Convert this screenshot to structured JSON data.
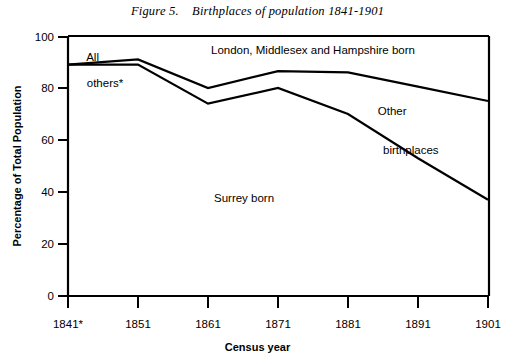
{
  "figure": {
    "title": "Figure 5.    Birthplaces of population 1841-1901"
  },
  "chart_data": {
    "type": "line",
    "title": "Figure 5.    Birthplaces of population 1841-1901",
    "xlabel": "Census year",
    "ylabel": "Percentage of Total Population",
    "xlim": [
      1841,
      1901
    ],
    "ylim": [
      0,
      100
    ],
    "grid": false,
    "legend_position": "inline-annotations",
    "x": [
      1841,
      1851,
      1861,
      1871,
      1881,
      1891,
      1901
    ],
    "xtick_labels": [
      "1841*",
      "1851",
      "1861",
      "1871",
      "1881",
      "1891",
      "1901"
    ],
    "ytick_labels": [
      "0",
      "20",
      "40",
      "60",
      "80",
      "100"
    ],
    "ytick_values": [
      0,
      20,
      40,
      60,
      80,
      100
    ],
    "series": [
      {
        "name": "Surrey born (cumulative upper boundary)",
        "annotation": "Surrey born",
        "values": [
          89,
          91,
          80,
          86.5,
          86,
          80.5,
          75
        ]
      },
      {
        "name": "Surrey + other birthplaces (cumulative lower boundary)",
        "annotation": "Other birthplaces",
        "values": [
          89,
          89,
          74,
          80,
          70,
          53,
          37
        ]
      }
    ],
    "annotations": [
      {
        "text": "All\nothers*",
        "x": 1841,
        "y": 95
      },
      {
        "text": "London, Middlesex and Hampshire born",
        "x": 1866,
        "y": 93
      },
      {
        "text": "Other\n    birthplaces",
        "x": 1886,
        "y": 75
      },
      {
        "text": "Surrey born",
        "x": 1866,
        "y": 40
      }
    ]
  },
  "labels": {
    "all_others_line1": "All",
    "all_others_line2": "others*",
    "london": "London, Middlesex and Hampshire born",
    "other_line1": "Other",
    "other_line2": "birthplaces",
    "surrey": "Surrey born"
  }
}
